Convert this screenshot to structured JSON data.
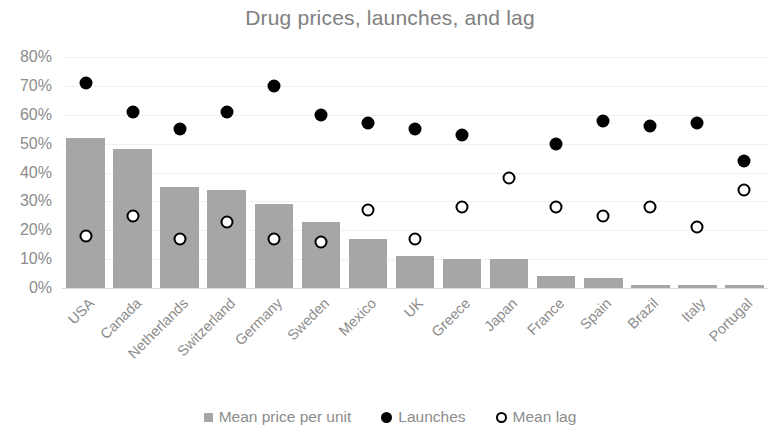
{
  "chart_data": {
    "type": "bar",
    "title": "Drug prices, launches, and lag",
    "xlabel": "",
    "ylabel": "",
    "ylim": [
      0,
      80
    ],
    "y_unit": "%",
    "grid": true,
    "legend_position": "bottom",
    "categories": [
      "USA",
      "Canada",
      "Netherlands",
      "Switzerland",
      "Germany",
      "Sweden",
      "Mexico",
      "UK",
      "Greece",
      "Japan",
      "France",
      "Spain",
      "Brazil",
      "Italy",
      "Portugal"
    ],
    "y_ticks": [
      "0%",
      "10%",
      "20%",
      "30%",
      "40%",
      "50%",
      "60%",
      "70%",
      "80%"
    ],
    "y_tick_values": [
      0,
      10,
      20,
      30,
      40,
      50,
      60,
      70,
      80
    ],
    "series": [
      {
        "name": "Mean price per unit",
        "type": "bar",
        "color": "#a6a6a6",
        "values": [
          52,
          48,
          35,
          34,
          29,
          23,
          17,
          11,
          10,
          10,
          4,
          3.5,
          1,
          1,
          1
        ]
      },
      {
        "name": "Launches",
        "type": "scatter",
        "marker": "filled-circle",
        "color": "#000000",
        "values": [
          71,
          61,
          55,
          61,
          70,
          60,
          57,
          55,
          53,
          null,
          50,
          58,
          56,
          57,
          44
        ]
      },
      {
        "name": "Mean lag",
        "type": "scatter",
        "marker": "open-circle",
        "color": "#000000",
        "values": [
          18,
          25,
          17,
          23,
          17,
          16,
          27,
          17,
          28,
          38,
          28,
          25,
          28,
          21,
          34
        ]
      }
    ]
  },
  "legend": {
    "items": [
      {
        "label": "Mean price per unit",
        "marker": "square-marker"
      },
      {
        "label": "Launches",
        "marker": "filled-circle-marker"
      },
      {
        "label": "Mean lag",
        "marker": "open-circle-marker"
      }
    ]
  },
  "colors": {
    "bar": "#a6a6a6",
    "marker": "#000000",
    "text": "#808080",
    "gridline": "#f0f0f0"
  }
}
